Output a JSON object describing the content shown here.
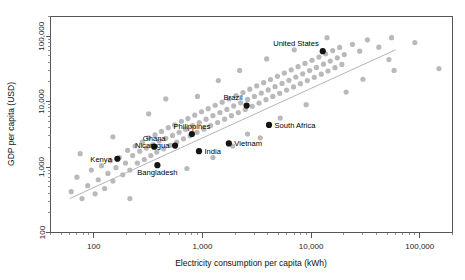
{
  "chart_data": {
    "type": "scatter",
    "title": "",
    "xlabel": "Electricity consumption per capita (kWh)",
    "ylabel": "GDP per capita (USD)",
    "xscale": "log",
    "yscale": "log",
    "xlim": [
      40,
      200000
    ],
    "ylim": [
      100,
      200000
    ],
    "xticks": [
      100,
      1000,
      10000,
      100000
    ],
    "xticklabels": [
      "100",
      "1,000",
      "10,000",
      "100,000"
    ],
    "yticks": [
      100,
      1000,
      10000,
      100000
    ],
    "yticklabels": [
      "100",
      "1,000",
      "10,000",
      "100,000"
    ],
    "grid": false,
    "legend": "none",
    "trendline": {
      "present": true,
      "color": "#b5b5b5",
      "x": [
        60,
        60000
      ],
      "y": [
        330,
        62000
      ]
    },
    "series": [
      {
        "name": "All countries",
        "color": "#b9b9b9",
        "marker": "circle",
        "points": [
          {
            "x": 62,
            "y": 420
          },
          {
            "x": 70,
            "y": 700
          },
          {
            "x": 78,
            "y": 330
          },
          {
            "x": 88,
            "y": 520
          },
          {
            "x": 95,
            "y": 900
          },
          {
            "x": 103,
            "y": 390
          },
          {
            "x": 110,
            "y": 640
          },
          {
            "x": 118,
            "y": 1050
          },
          {
            "x": 126,
            "y": 470
          },
          {
            "x": 135,
            "y": 800
          },
          {
            "x": 142,
            "y": 1250
          },
          {
            "x": 150,
            "y": 610
          },
          {
            "x": 160,
            "y": 980
          },
          {
            "x": 172,
            "y": 1400
          },
          {
            "x": 185,
            "y": 760
          },
          {
            "x": 196,
            "y": 1150
          },
          {
            "x": 205,
            "y": 1800
          },
          {
            "x": 215,
            "y": 900
          },
          {
            "x": 228,
            "y": 1500
          },
          {
            "x": 240,
            "y": 2100
          },
          {
            "x": 252,
            "y": 1150
          },
          {
            "x": 265,
            "y": 1750
          },
          {
            "x": 280,
            "y": 2400
          },
          {
            "x": 292,
            "y": 1300
          },
          {
            "x": 305,
            "y": 1950
          },
          {
            "x": 320,
            "y": 2800
          },
          {
            "x": 335,
            "y": 1500
          },
          {
            "x": 350,
            "y": 2200
          },
          {
            "x": 366,
            "y": 3100
          },
          {
            "x": 380,
            "y": 1700
          },
          {
            "x": 400,
            "y": 2500
          },
          {
            "x": 420,
            "y": 3500
          },
          {
            "x": 440,
            "y": 1900
          },
          {
            "x": 460,
            "y": 2750
          },
          {
            "x": 485,
            "y": 4000
          },
          {
            "x": 505,
            "y": 2150
          },
          {
            "x": 530,
            "y": 3050
          },
          {
            "x": 555,
            "y": 4400
          },
          {
            "x": 580,
            "y": 2400
          },
          {
            "x": 610,
            "y": 3400
          },
          {
            "x": 640,
            "y": 5000
          },
          {
            "x": 670,
            "y": 2700
          },
          {
            "x": 700,
            "y": 3800
          },
          {
            "x": 735,
            "y": 5500
          },
          {
            "x": 770,
            "y": 3000
          },
          {
            "x": 810,
            "y": 4300
          },
          {
            "x": 850,
            "y": 6200
          },
          {
            "x": 890,
            "y": 3400
          },
          {
            "x": 935,
            "y": 4800
          },
          {
            "x": 980,
            "y": 7000
          },
          {
            "x": 1030,
            "y": 3800
          },
          {
            "x": 1080,
            "y": 5400
          },
          {
            "x": 1130,
            "y": 7800
          },
          {
            "x": 1190,
            "y": 4300
          },
          {
            "x": 1250,
            "y": 6100
          },
          {
            "x": 1310,
            "y": 8800
          },
          {
            "x": 1380,
            "y": 4800
          },
          {
            "x": 1450,
            "y": 6800
          },
          {
            "x": 1520,
            "y": 9800
          },
          {
            "x": 1600,
            "y": 5400
          },
          {
            "x": 1680,
            "y": 7600
          },
          {
            "x": 1760,
            "y": 11000
          },
          {
            "x": 1850,
            "y": 6100
          },
          {
            "x": 1940,
            "y": 8600
          },
          {
            "x": 2040,
            "y": 12400
          },
          {
            "x": 2140,
            "y": 6800
          },
          {
            "x": 2250,
            "y": 9600
          },
          {
            "x": 2360,
            "y": 13800
          },
          {
            "x": 2480,
            "y": 7600
          },
          {
            "x": 2600,
            "y": 10800
          },
          {
            "x": 2730,
            "y": 15500
          },
          {
            "x": 2870,
            "y": 8500
          },
          {
            "x": 3010,
            "y": 12000
          },
          {
            "x": 3160,
            "y": 17400
          },
          {
            "x": 3320,
            "y": 9500
          },
          {
            "x": 3480,
            "y": 13500
          },
          {
            "x": 3660,
            "y": 19500
          },
          {
            "x": 3840,
            "y": 10700
          },
          {
            "x": 4030,
            "y": 15100
          },
          {
            "x": 4230,
            "y": 21800
          },
          {
            "x": 4440,
            "y": 12000
          },
          {
            "x": 4660,
            "y": 16900
          },
          {
            "x": 4900,
            "y": 24400
          },
          {
            "x": 5140,
            "y": 13400
          },
          {
            "x": 5400,
            "y": 19000
          },
          {
            "x": 5670,
            "y": 27300
          },
          {
            "x": 5950,
            "y": 15000
          },
          {
            "x": 6250,
            "y": 21200
          },
          {
            "x": 6560,
            "y": 30600
          },
          {
            "x": 6890,
            "y": 16800
          },
          {
            "x": 7230,
            "y": 23800
          },
          {
            "x": 7590,
            "y": 34200
          },
          {
            "x": 7970,
            "y": 18800
          },
          {
            "x": 8370,
            "y": 26600
          },
          {
            "x": 8790,
            "y": 38300
          },
          {
            "x": 9230,
            "y": 21000
          },
          {
            "x": 9690,
            "y": 29800
          },
          {
            "x": 10200,
            "y": 42900
          },
          {
            "x": 10700,
            "y": 23500
          },
          {
            "x": 11200,
            "y": 33300
          },
          {
            "x": 11800,
            "y": 48000
          },
          {
            "x": 12400,
            "y": 26300
          },
          {
            "x": 13000,
            "y": 37300
          },
          {
            "x": 13600,
            "y": 53800
          },
          {
            "x": 14300,
            "y": 29400
          },
          {
            "x": 15000,
            "y": 41700
          },
          {
            "x": 15800,
            "y": 60200
          },
          {
            "x": 16600,
            "y": 33000
          },
          {
            "x": 17400,
            "y": 46700
          },
          {
            "x": 18300,
            "y": 67400
          },
          {
            "x": 19200,
            "y": 37000
          },
          {
            "x": 20200,
            "y": 52300
          },
          {
            "x": 24000,
            "y": 75000
          },
          {
            "x": 28000,
            "y": 59000
          },
          {
            "x": 33000,
            "y": 88000
          },
          {
            "x": 42000,
            "y": 68000
          },
          {
            "x": 55000,
            "y": 95000
          },
          {
            "x": 90000,
            "y": 80000
          },
          {
            "x": 150,
            "y": 2900
          },
          {
            "x": 320,
            "y": 6500
          },
          {
            "x": 900,
            "y": 12000
          },
          {
            "x": 2600,
            "y": 3200
          },
          {
            "x": 5200,
            "y": 5600
          },
          {
            "x": 150000,
            "y": 32000
          },
          {
            "x": 58000,
            "y": 30000
          },
          {
            "x": 30000,
            "y": 22000
          },
          {
            "x": 460,
            "y": 11000
          },
          {
            "x": 1250,
            "y": 1400
          },
          {
            "x": 3400,
            "y": 2800
          },
          {
            "x": 75,
            "y": 1600
          },
          {
            "x": 215,
            "y": 330
          },
          {
            "x": 720,
            "y": 950
          },
          {
            "x": 1900,
            "y": 2100
          },
          {
            "x": 9000,
            "y": 9000
          },
          {
            "x": 21000,
            "y": 14000
          },
          {
            "x": 14000,
            "y": 95000
          },
          {
            "x": 7000,
            "y": 62000
          },
          {
            "x": 3900,
            "y": 45000
          },
          {
            "x": 2200,
            "y": 30000
          },
          {
            "x": 1400,
            "y": 21000
          },
          {
            "x": 52000,
            "y": 44000
          }
        ]
      },
      {
        "name": "Highlighted countries",
        "color": "#141414",
        "marker": "circle",
        "points": [
          {
            "label": "Kenya",
            "x": 165,
            "y": 1340,
            "label_side": "left"
          },
          {
            "label": "Ghana",
            "x": 360,
            "y": 2050,
            "label_side": "above"
          },
          {
            "label": "Bangladesh",
            "x": 385,
            "y": 1070,
            "label_side": "below"
          },
          {
            "label": "Nicaragua",
            "x": 560,
            "y": 2130,
            "label_side": "left"
          },
          {
            "label": "Philippines",
            "x": 800,
            "y": 3200,
            "label_side": "above"
          },
          {
            "label": "India",
            "x": 930,
            "y": 1750,
            "label_side": "right"
          },
          {
            "label": "Vietnam",
            "x": 1750,
            "y": 2300,
            "label_side": "right"
          },
          {
            "label": "Brazil",
            "x": 2550,
            "y": 8700,
            "label_side": "above-left"
          },
          {
            "label": "South Africa",
            "x": 4100,
            "y": 4400,
            "label_side": "right"
          },
          {
            "label": "United States",
            "x": 12800,
            "y": 59000,
            "label_side": "above-left"
          }
        ]
      }
    ]
  },
  "axes": {
    "x_title": "Electricity consumption per capita (kWh)",
    "y_title": "GDP per capita (USD)",
    "x_tick_labels": [
      "100",
      "1,000",
      "10,000",
      "100,000"
    ],
    "y_tick_labels": [
      "100",
      "1,000",
      "10,000",
      "100,000"
    ]
  },
  "colors": {
    "background_points": "#b9b9b9",
    "highlight_points": "#141414",
    "trendline": "#b5b5b5",
    "frame": "#55555a",
    "text": "#101010",
    "page_background": "#ffffff"
  }
}
